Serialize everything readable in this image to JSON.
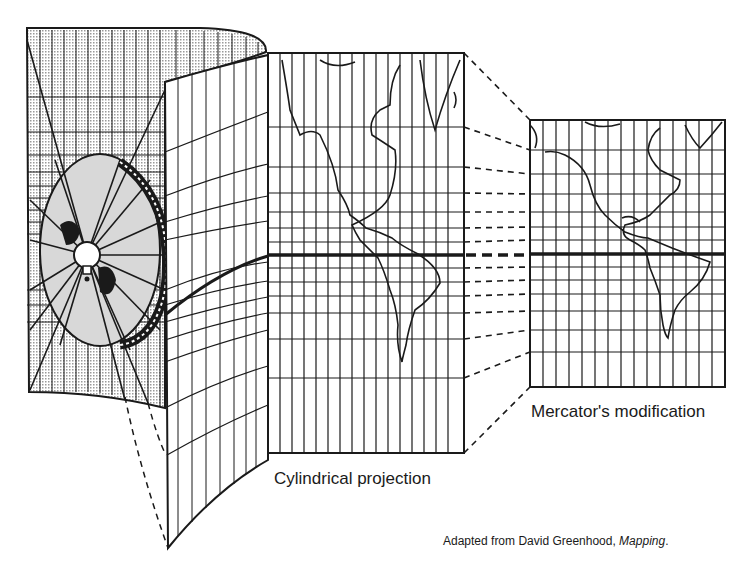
{
  "figure": {
    "clipped_caption_fragment": "",
    "panels": [
      {
        "id": "cylinder",
        "description": "Light source inside transparent globe projecting graticule onto a cylinder"
      },
      {
        "id": "cylindrical",
        "label": "Cylindrical projection"
      },
      {
        "id": "mercator",
        "label": "Mercator's modification"
      }
    ],
    "labels": {
      "cylindrical": "Cylindrical projection",
      "mercator": "Mercator's modification"
    },
    "credit": {
      "prefix": "Adapted from David Greenhood, ",
      "title": "Mapping",
      "suffix": "."
    },
    "colors": {
      "ink": "#1a1a1a",
      "shade": "#cfcfcf",
      "paper": "#ffffff"
    }
  }
}
